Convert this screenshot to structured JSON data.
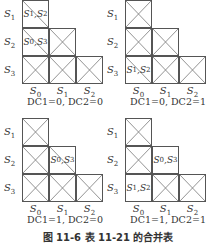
{
  "diagram": {
    "row_labels": [
      "S1",
      "S2",
      "S3"
    ],
    "col_labels": [
      "S0",
      "S1",
      "S2"
    ],
    "caption": "图 11-6 表 11-21 的合并表",
    "panels": [
      {
        "condition": "DC1=0,  DC2=0",
        "cells": {
          "S1_S0": {
            "type": "slash",
            "text": "S1, S2"
          },
          "S2_S0": {
            "type": "slash",
            "text": "S0, S3"
          },
          "S2_S1": {
            "type": "cross"
          },
          "S3_S0": {
            "type": "cross"
          },
          "S3_S1": {
            "type": "cross"
          },
          "S3_S2": {
            "type": "cross"
          }
        }
      },
      {
        "condition": "DC1=0,  DC2=1",
        "cells": {
          "S1_S0": {
            "type": "cross"
          },
          "S2_S0": {
            "type": "cross"
          },
          "S2_S1": {
            "type": "cross"
          },
          "S3_S0": {
            "type": "slash",
            "text": "S1, S2"
          },
          "S3_S1": {
            "type": "cross"
          },
          "S3_S2": {
            "type": "cross"
          }
        }
      },
      {
        "condition": "DC1=1,  DC2=0",
        "cells": {
          "S1_S0": {
            "type": "cross"
          },
          "S2_S0": {
            "type": "cross"
          },
          "S2_S1": {
            "type": "slash",
            "text": "S0, S3"
          },
          "S3_S0": {
            "type": "cross"
          },
          "S3_S1": {
            "type": "cross"
          },
          "S3_S2": {
            "type": "cross"
          }
        }
      },
      {
        "condition": "DC1=1,  DC2=1",
        "cells": {
          "S1_S0": {
            "type": "cross"
          },
          "S2_S0": {
            "type": "cross"
          },
          "S2_S1": {
            "type": "text",
            "text": "S0, S3"
          },
          "S3_S0": {
            "type": "text",
            "text": "S1, S2"
          },
          "S3_S1": {
            "type": "cross"
          },
          "S3_S2": {
            "type": "cross"
          }
        }
      }
    ]
  }
}
